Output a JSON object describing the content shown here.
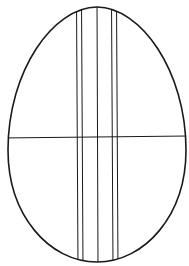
{
  "colors": {
    "background": "#ffffff",
    "stroke": "#1a1a1a"
  },
  "egg": {
    "top_y": 7,
    "bottom_y": 262,
    "left_x": 8,
    "right_x": 186,
    "center_x": 97,
    "widest_y": 150
  },
  "vertical_lines_x": [
    76,
    81,
    97,
    112,
    116
  ],
  "horizontal_line_y": 137
}
